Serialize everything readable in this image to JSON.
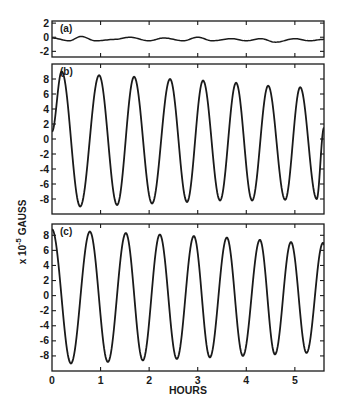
{
  "chart_data": {
    "type": "line",
    "title": "",
    "xlabel": "HOURS",
    "ylabel": "x 10^-5 GAUSS",
    "ylabel_parts": {
      "prefix": "x 10",
      "exponent": "-5",
      "suffix": " GAUSS"
    },
    "xlim": [
      0,
      5.6
    ],
    "x_ticks": [
      0,
      1,
      2,
      3,
      4,
      5
    ],
    "x_tick_labels": [
      "0",
      "1",
      "2",
      "3",
      "4",
      "5"
    ],
    "grid": false,
    "legend": null,
    "panels": [
      {
        "label": "(a)",
        "ylim": [
          -2.8,
          2.3
        ],
        "y_ticks": [
          2,
          0,
          -2
        ],
        "y_tick_labels": [
          "2",
          "0",
          "-2"
        ],
        "description": "Near-zero residual trace with small wiggles",
        "series": {
          "name": "panel a",
          "x": [
            0,
            0.35,
            0.6,
            0.9,
            1.3,
            1.6,
            2.0,
            2.3,
            2.7,
            3.0,
            3.3,
            3.7,
            4.0,
            4.3,
            4.6,
            5.0,
            5.3,
            5.6
          ],
          "y": [
            -0.1,
            -0.5,
            0.1,
            -0.5,
            -0.3,
            0.0,
            -0.5,
            -0.1,
            -0.5,
            0.0,
            -0.5,
            -0.2,
            -0.5,
            -0.2,
            -0.7,
            -0.2,
            -0.5,
            -0.3
          ]
        }
      },
      {
        "label": "(b)",
        "ylim": [
          -10,
          10
        ],
        "y_ticks": [
          8,
          6,
          4,
          2,
          0,
          -2,
          -4,
          -6,
          -8
        ],
        "y_tick_labels": [
          "8",
          "6",
          "4",
          "2",
          "0",
          "-2",
          "-4",
          "-6",
          "-8"
        ],
        "description": "Damped sinusoidal oscillation, period ~0.7 h",
        "peaks": {
          "x": [
            0.2,
            0.97,
            1.69,
            2.43,
            3.11,
            3.79,
            4.45,
            5.11
          ],
          "y": [
            9.0,
            8.5,
            8.3,
            8.0,
            7.8,
            7.5,
            7.1,
            6.9
          ]
        },
        "troughs": {
          "x": [
            0.58,
            1.34,
            2.06,
            2.78,
            3.46,
            4.12,
            4.8,
            5.45
          ],
          "y": [
            -9.0,
            -8.8,
            -8.6,
            -8.4,
            -8.2,
            -8.2,
            -8.1,
            -8.0
          ]
        },
        "start": {
          "x": 0,
          "y": 1.0
        },
        "end": {
          "x": 5.6,
          "y": 1.5
        }
      },
      {
        "label": "(c)",
        "ylim": [
          -10,
          9.5
        ],
        "y_ticks": [
          8,
          6,
          4,
          2,
          0,
          -2,
          -4,
          -6,
          -8
        ],
        "y_tick_labels": [
          "8",
          "6",
          "4",
          "2",
          "0",
          "-2",
          "-4",
          "-6",
          "-8"
        ],
        "description": "Damped sinusoidal oscillation, period ~0.7 h",
        "peaks": {
          "x": [
            0.0,
            0.78,
            1.52,
            2.22,
            2.92,
            3.6,
            4.28,
            4.92,
            5.58
          ],
          "y": [
            8.8,
            8.5,
            8.3,
            8.1,
            7.9,
            7.7,
            7.4,
            7.1,
            7.0
          ]
        },
        "troughs": {
          "x": [
            0.39,
            1.15,
            1.87,
            2.57,
            3.25,
            3.93,
            4.59,
            5.24
          ],
          "y": [
            -9.0,
            -8.8,
            -8.6,
            -8.4,
            -8.2,
            -8.0,
            -7.8,
            -7.6
          ]
        },
        "end": {
          "x": 5.6,
          "y": 6.8
        }
      }
    ]
  },
  "panel_labels": {
    "a": "(a)",
    "b": "(b)",
    "c": "(c)"
  },
  "axis": {
    "xlabel": "HOURS",
    "ylabel_prefix": "x 10",
    "ylabel_exponent": "-5",
    "ylabel_suffix": "GAUSS"
  },
  "colors": {
    "line": "#1a1a1a",
    "background": "#ffffff"
  }
}
